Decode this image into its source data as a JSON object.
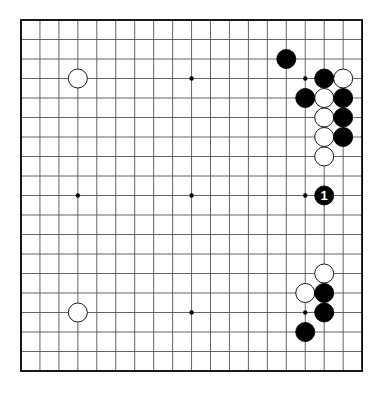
{
  "board": {
    "size": 19,
    "origin_x": 21,
    "origin_y": 20,
    "step_x": 18.95,
    "step_y": 19.5,
    "stone_radius": 9.5,
    "line_color": "#555555",
    "border_color": "#000000",
    "background": "#ffffff",
    "star_points": [
      [
        3,
        3
      ],
      [
        9,
        3
      ],
      [
        15,
        3
      ],
      [
        3,
        9
      ],
      [
        9,
        9
      ],
      [
        15,
        9
      ],
      [
        3,
        15
      ],
      [
        9,
        15
      ],
      [
        15,
        15
      ]
    ]
  },
  "stones": [
    {
      "color": "white",
      "col": 3,
      "row": 3
    },
    {
      "color": "white",
      "col": 3,
      "row": 15
    },
    {
      "color": "black",
      "col": 14,
      "row": 2
    },
    {
      "color": "black",
      "col": 16,
      "row": 3
    },
    {
      "color": "white",
      "col": 17,
      "row": 3
    },
    {
      "color": "black",
      "col": 15,
      "row": 4
    },
    {
      "color": "white",
      "col": 16,
      "row": 4
    },
    {
      "color": "black",
      "col": 17,
      "row": 4
    },
    {
      "color": "white",
      "col": 16,
      "row": 5
    },
    {
      "color": "black",
      "col": 17,
      "row": 5
    },
    {
      "color": "white",
      "col": 16,
      "row": 6
    },
    {
      "color": "black",
      "col": 17,
      "row": 6
    },
    {
      "color": "white",
      "col": 16,
      "row": 7
    },
    {
      "color": "black",
      "col": 16,
      "row": 9,
      "label": "1"
    },
    {
      "color": "white",
      "col": 16,
      "row": 13
    },
    {
      "color": "white",
      "col": 15,
      "row": 14
    },
    {
      "color": "black",
      "col": 16,
      "row": 14
    },
    {
      "color": "black",
      "col": 16,
      "row": 15
    },
    {
      "color": "black",
      "col": 15,
      "row": 16
    }
  ]
}
